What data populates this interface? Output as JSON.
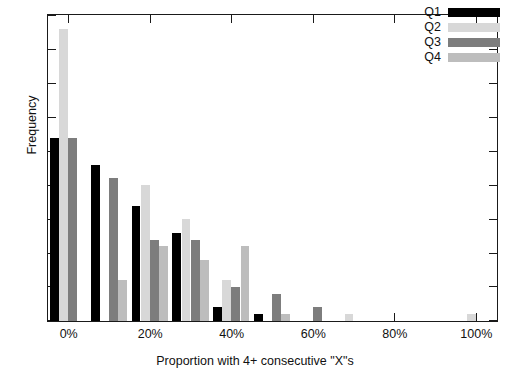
{
  "chart_data": {
    "type": "bar",
    "title": "",
    "xlabel": "Proportion with 4+ consecutive \"X\"s",
    "ylabel": "Frequency",
    "categories": [
      "0%",
      "10%",
      "20%",
      "30%",
      "40%",
      "50%",
      "60%",
      "70%",
      "80%",
      "90%",
      "100%"
    ],
    "series": [
      {
        "name": "Q1",
        "color": "#000000",
        "values": [
          27,
          23,
          17,
          13,
          2,
          1,
          0,
          0,
          0,
          0,
          0
        ]
      },
      {
        "name": "Q2",
        "color": "#d8d8d8",
        "values": [
          43,
          0,
          20,
          15,
          6,
          0,
          0,
          1,
          0,
          0,
          1
        ]
      },
      {
        "name": "Q3",
        "color": "#7d7d7d",
        "values": [
          27,
          21,
          12,
          12,
          5,
          4,
          2,
          0,
          0,
          0,
          0
        ]
      },
      {
        "name": "Q4",
        "color": "#bdbdbd",
        "values": [
          0,
          6,
          11,
          9,
          11,
          1,
          0,
          0,
          0,
          0,
          0
        ]
      }
    ],
    "xlim": [
      -5,
      105
    ],
    "ylim": [
      0,
      45
    ],
    "yticks": [
      0,
      5,
      10,
      15,
      20,
      25,
      30,
      35,
      40,
      45
    ],
    "xticks": [
      0,
      20,
      40,
      60,
      80,
      100
    ],
    "xtick_labels": [
      "0%",
      "20%",
      "40%",
      "60%",
      "80%",
      "100%"
    ],
    "ytick_labels": [
      "0",
      "5",
      "10",
      "15",
      "20",
      "25",
      "30",
      "35",
      "40",
      "45"
    ],
    "grid": false,
    "legend_position": "top-right",
    "bar_group_width_pct": 9.0
  },
  "legend": {
    "entries": [
      {
        "label": "Q1"
      },
      {
        "label": "Q2"
      },
      {
        "label": "Q3"
      },
      {
        "label": "Q4"
      }
    ]
  }
}
